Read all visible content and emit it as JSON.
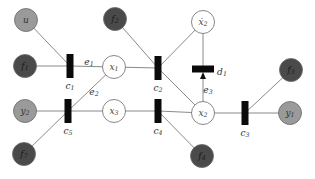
{
  "diagram": {
    "colors": {
      "edge": "#8a8a8a",
      "factor": "#0a0a0a",
      "dark_node": "#4a4a4a",
      "light_node": "#9a9a9a",
      "var_node": "#ffffff",
      "stroke": "#6a6a6a"
    },
    "nodes": [
      {
        "id": "u",
        "label": "u",
        "sub": "",
        "kind": "light",
        "x": 26,
        "y": 20
      },
      {
        "id": "f1",
        "label": "f",
        "sub": "1",
        "kind": "dark",
        "x": 25,
        "y": 66
      },
      {
        "id": "y2",
        "label": "y",
        "sub": "2",
        "kind": "light",
        "x": 25,
        "y": 111
      },
      {
        "id": "f7",
        "label": "f",
        "sub": "7",
        "kind": "dark",
        "x": 24,
        "y": 154
      },
      {
        "id": "x1",
        "label": "x",
        "sub": "1",
        "kind": "var",
        "x": 114,
        "y": 67
      },
      {
        "id": "x3",
        "label": "x",
        "sub": "3",
        "kind": "var",
        "x": 114,
        "y": 111
      },
      {
        "id": "f2",
        "label": "f",
        "sub": "2",
        "kind": "dark",
        "x": 115,
        "y": 19
      },
      {
        "id": "xd2",
        "label": "ẋ",
        "sub": "2",
        "kind": "var",
        "x": 203,
        "y": 22
      },
      {
        "id": "x2",
        "label": "x",
        "sub": "2",
        "kind": "var",
        "x": 203,
        "y": 113
      },
      {
        "id": "f4",
        "label": "f",
        "sub": "4",
        "kind": "dark",
        "x": 202,
        "y": 156
      },
      {
        "id": "f3",
        "label": "f",
        "sub": "3",
        "kind": "dark",
        "x": 291,
        "y": 70
      },
      {
        "id": "y1",
        "label": "y",
        "sub": "1",
        "kind": "light",
        "x": 290,
        "y": 113
      }
    ],
    "factors": [
      {
        "id": "c1",
        "label": "c",
        "sub": "1",
        "x": 70,
        "y": 66,
        "orient": "v",
        "lx": 70,
        "ly": 86
      },
      {
        "id": "c2",
        "label": "c",
        "sub": "2",
        "x": 158,
        "y": 68,
        "orient": "v",
        "lx": 158,
        "ly": 88
      },
      {
        "id": "c3",
        "label": "c",
        "sub": "3",
        "x": 245,
        "y": 113,
        "orient": "v",
        "lx": 245,
        "ly": 133
      },
      {
        "id": "c4",
        "label": "c",
        "sub": "4",
        "x": 158,
        "y": 111,
        "orient": "v",
        "lx": 158,
        "ly": 131
      },
      {
        "id": "c5",
        "label": "c",
        "sub": "5",
        "x": 68,
        "y": 111,
        "orient": "v",
        "lx": 68,
        "ly": 131
      },
      {
        "id": "d1",
        "label": "d",
        "sub": "1",
        "x": 203,
        "y": 69,
        "orient": "h",
        "lx": 222,
        "ly": 72
      }
    ],
    "edges": [
      {
        "from": "u",
        "to": "c1"
      },
      {
        "from": "f1",
        "to": "c1"
      },
      {
        "from": "c1",
        "to": "x1"
      },
      {
        "from": "x1",
        "to": "c5"
      },
      {
        "from": "y2",
        "to": "c5"
      },
      {
        "from": "f7",
        "to": "c5"
      },
      {
        "from": "c5",
        "to": "x3"
      },
      {
        "from": "x3",
        "to": "c4"
      },
      {
        "from": "c4",
        "to": "x2"
      },
      {
        "from": "c4",
        "to": "f4"
      },
      {
        "from": "x1",
        "to": "c2"
      },
      {
        "from": "f2",
        "to": "c2"
      },
      {
        "from": "c2",
        "to": "xd2"
      },
      {
        "from": "c2",
        "to": "x2"
      },
      {
        "from": "xd2",
        "to": "d1"
      },
      {
        "from": "x2",
        "to": "c3"
      },
      {
        "from": "c3",
        "to": "y1"
      },
      {
        "from": "c3",
        "to": "f3"
      }
    ],
    "arrow": {
      "from": "x2",
      "to": "d1"
    },
    "edge_labels": [
      {
        "label": "e",
        "sub": "1",
        "x": 89,
        "y": 62
      },
      {
        "label": "e",
        "sub": "2",
        "x": 94,
        "y": 92
      },
      {
        "label": "e",
        "sub": "3",
        "x": 208,
        "y": 90
      }
    ]
  }
}
